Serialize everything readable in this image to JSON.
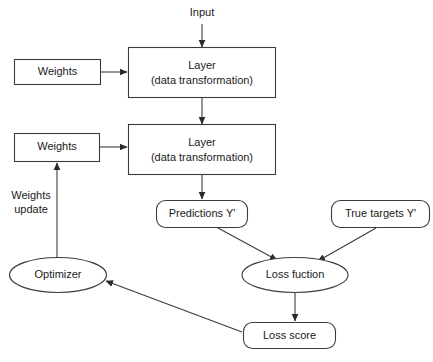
{
  "diagram": {
    "title_caption": "",
    "colors": {
      "background": "#ffffff",
      "stroke": "#3c3c3c",
      "text": "#1a1a1a",
      "arrowhead": "#2b2b2b",
      "caption": "#8a8a8a"
    },
    "nodes": {
      "input": {
        "label": "Input",
        "shape": "text"
      },
      "weights_top": {
        "label": "Weights",
        "shape": "rectangle"
      },
      "layer_top": {
        "label_line1": "Layer",
        "label_line2": "(data transformation)",
        "shape": "rectangle"
      },
      "weights_bottom": {
        "label": "Weights",
        "shape": "rectangle"
      },
      "layer_bottom": {
        "label_line1": "Layer",
        "label_line2": "(data transformation)",
        "shape": "rectangle"
      },
      "predictions": {
        "label": "Predictions Y'",
        "shape": "rounded-rectangle"
      },
      "true_targets": {
        "label": "True targets Y'",
        "shape": "rounded-rectangle"
      },
      "loss_function": {
        "label": "Loss fuction",
        "shape": "ellipse"
      },
      "loss_score": {
        "label": "Loss score",
        "shape": "rounded-rectangle"
      },
      "optimizer": {
        "label": "Optimizer",
        "shape": "ellipse"
      },
      "weights_update": {
        "label_line1": "Weights",
        "label_line2": "update",
        "shape": "text"
      }
    },
    "edges": [
      {
        "from": "input",
        "to": "layer_top",
        "arrow": true
      },
      {
        "from": "weights_top",
        "to": "layer_top",
        "arrow": true
      },
      {
        "from": "layer_top",
        "to": "layer_bottom",
        "arrow": true
      },
      {
        "from": "weights_bottom",
        "to": "layer_bottom",
        "arrow": true
      },
      {
        "from": "layer_bottom",
        "to": "predictions",
        "arrow": true
      },
      {
        "from": "predictions",
        "to": "loss_function",
        "arrow": true
      },
      {
        "from": "true_targets",
        "to": "loss_function",
        "arrow": true
      },
      {
        "from": "loss_function",
        "to": "loss_score",
        "arrow": true
      },
      {
        "from": "loss_score",
        "to": "optimizer",
        "arrow": true
      },
      {
        "from": "optimizer",
        "to": "weights_bottom",
        "arrow": true,
        "label": "weights_update"
      }
    ]
  }
}
